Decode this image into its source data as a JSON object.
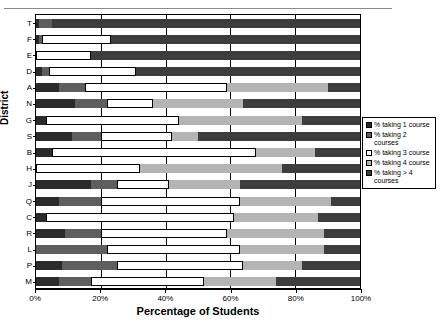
{
  "chart_data": {
    "type": "bar",
    "orientation": "horizontal",
    "stacked": true,
    "stack_mode": "percent",
    "title": "",
    "xlabel": "Percentage of Students",
    "ylabel": "District",
    "xlim": [
      0,
      100
    ],
    "xticks": [
      "0%",
      "20%",
      "40%",
      "60%",
      "80%",
      "100%"
    ],
    "xtick_values": [
      0,
      20,
      40,
      60,
      80,
      100
    ],
    "grid": true,
    "legend_position": "right",
    "categories": [
      "T",
      "F",
      "E",
      "D",
      "A",
      "N",
      "G",
      "S",
      "B",
      "H",
      "J",
      "Q",
      "C",
      "R",
      "L",
      "P",
      "M"
    ],
    "series": [
      {
        "name": "% taking 1 course",
        "color": "#2b2b2b",
        "values": [
          1,
          1,
          0,
          2,
          7,
          12,
          3,
          11,
          5,
          0,
          17,
          7,
          3,
          9,
          0,
          8,
          7
        ]
      },
      {
        "name": "% taking 2 courses",
        "color": "#5e5e5e",
        "values": [
          4,
          1,
          0,
          2,
          8,
          10,
          0,
          9,
          0,
          0,
          8,
          13,
          0,
          11,
          22,
          17,
          10
        ]
      },
      {
        "name": "% taking 3 course",
        "color": "#ffffff",
        "values": [
          0,
          21,
          17,
          27,
          44,
          14,
          41,
          22,
          63,
          32,
          16,
          43,
          58,
          39,
          41,
          39,
          35
        ]
      },
      {
        "name": "% taking 4 course",
        "color": "#b4b4b4",
        "values": [
          0,
          0,
          0,
          0,
          31,
          28,
          38,
          8,
          18,
          44,
          22,
          28,
          26,
          30,
          26,
          18,
          22
        ]
      },
      {
        "name": "% taking > 4 courses",
        "color": "#3d3d3d",
        "values": [
          95,
          77,
          83,
          69,
          10,
          36,
          18,
          50,
          14,
          24,
          37,
          9,
          13,
          11,
          11,
          18,
          26
        ]
      }
    ]
  }
}
